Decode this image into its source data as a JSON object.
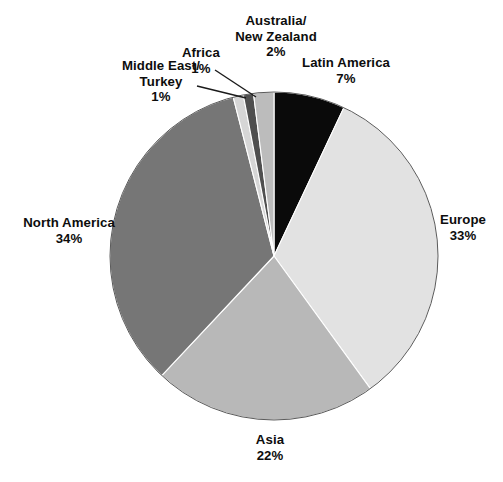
{
  "chart_data": {
    "type": "pie",
    "title": "",
    "categories": [
      "Latin America",
      "Europe",
      "Asia",
      "North America",
      "Middle East/Turkey",
      "Africa",
      "Australia/New Zealand"
    ],
    "values": [
      7,
      33,
      22,
      34,
      1,
      1,
      2
    ],
    "unit": "%",
    "start_angle_deg": 0,
    "direction": "clockwise",
    "legend": "none",
    "grid": false,
    "colors": [
      "#0a0a0a",
      "#e2e2e2",
      "#b8b8b8",
      "#767676",
      "#d6d6d6",
      "#4f4f4f",
      "#bcbcbc"
    ],
    "slices": [
      {
        "name": "Latin America",
        "value": 7,
        "label": "Latin America",
        "value_label": "7%",
        "color": "#0a0a0a",
        "leader": false
      },
      {
        "name": "Europe",
        "value": 33,
        "label": "Europe",
        "value_label": "33%",
        "color": "#e2e2e2",
        "leader": false
      },
      {
        "name": "Asia",
        "value": 22,
        "label": "Asia",
        "value_label": "22%",
        "color": "#b8b8b8",
        "leader": false
      },
      {
        "name": "North America",
        "value": 34,
        "label": "North America",
        "value_label": "34%",
        "color": "#767676",
        "leader": false
      },
      {
        "name": "Middle East/Turkey",
        "value": 1,
        "label": "Middle East/",
        "label2": "Turkey",
        "value_label": "1%",
        "color": "#d6d6d6",
        "leader": true
      },
      {
        "name": "Africa",
        "value": 1,
        "label": "Africa",
        "value_label": "1%",
        "color": "#4f4f4f",
        "leader": true
      },
      {
        "name": "Australia/New Zealand",
        "value": 2,
        "label": "Australia/",
        "label2": "New Zealand",
        "value_label": "2%",
        "color": "#bcbcbc",
        "leader": false
      }
    ]
  },
  "labels": {
    "australia": {
      "line1": "Australia/",
      "line2": "New Zealand",
      "pct": "2%"
    },
    "africa": {
      "line1": "Africa",
      "pct": "1%"
    },
    "latin": {
      "line1": "Latin America",
      "pct": "7%"
    },
    "middle": {
      "line1": "Middle East/",
      "line2": "Turkey",
      "pct": "1%"
    },
    "north": {
      "line1": "North America",
      "pct": "34%"
    },
    "europe": {
      "line1": "Europe",
      "pct": "33%"
    },
    "asia": {
      "line1": "Asia",
      "pct": "22%"
    }
  },
  "footer": {
    "cropped_text": "                    "
  }
}
